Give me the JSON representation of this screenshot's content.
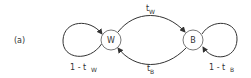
{
  "figure": {
    "panel_label": "(a)",
    "colors": {
      "stroke": "#333333",
      "node_fill": "#ffffff",
      "background": "#ffffff"
    },
    "nodes": [
      {
        "id": "W",
        "label": "W"
      },
      {
        "id": "B",
        "label": "B"
      }
    ],
    "edges": [
      {
        "from": "W",
        "to": "W",
        "label_main": "1 - t",
        "label_sub": "W",
        "type": "self-loop"
      },
      {
        "from": "W",
        "to": "B",
        "label_main": "t",
        "label_sub": "W",
        "type": "arc-top"
      },
      {
        "from": "B",
        "to": "W",
        "label_main": "t",
        "label_sub": "B",
        "type": "arc-bottom"
      },
      {
        "from": "B",
        "to": "B",
        "label_main": "1 - t",
        "label_sub": "B",
        "type": "self-loop"
      }
    ]
  }
}
